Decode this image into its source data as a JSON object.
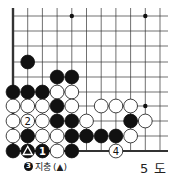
{
  "diagram": {
    "title": "5 도",
    "caption": {
      "move_number": "3",
      "text": "지충",
      "reference": "(▲)"
    },
    "board": {
      "columns": 11,
      "visible_rows": 10,
      "origin_x": 13,
      "spacing_x": 14.7,
      "row_y": [
        16,
        31,
        46,
        62,
        77,
        92,
        106,
        121,
        136,
        151
      ],
      "left_edge": true,
      "bottom_edge": true,
      "star_points": [
        [
          4,
          0
        ],
        [
          9,
          0
        ],
        [
          9,
          6
        ]
      ],
      "stones": [
        {
          "c": 1,
          "r": 3,
          "color": "black"
        },
        {
          "c": 3,
          "r": 4,
          "color": "black"
        },
        {
          "c": 4,
          "r": 4,
          "color": "black"
        },
        {
          "c": 0,
          "r": 5,
          "color": "black"
        },
        {
          "c": 1,
          "r": 5,
          "color": "black"
        },
        {
          "c": 2,
          "r": 5,
          "color": "black"
        },
        {
          "c": 3,
          "r": 5,
          "color": "white"
        },
        {
          "c": 4,
          "r": 5,
          "color": "white"
        },
        {
          "c": 0,
          "r": 6,
          "color": "white"
        },
        {
          "c": 1,
          "r": 6,
          "color": "white"
        },
        {
          "c": 2,
          "r": 6,
          "color": "white"
        },
        {
          "c": 3,
          "r": 6,
          "color": "black"
        },
        {
          "c": 4,
          "r": 6,
          "color": "white"
        },
        {
          "c": 6,
          "r": 6,
          "color": "white"
        },
        {
          "c": 7,
          "r": 6,
          "color": "white"
        },
        {
          "c": 8,
          "r": 6,
          "color": "white"
        },
        {
          "c": 0,
          "r": 7,
          "color": "white"
        },
        {
          "c": 1,
          "r": 7,
          "color": "white",
          "label": "2"
        },
        {
          "c": 2,
          "r": 7,
          "color": "white"
        },
        {
          "c": 3,
          "r": 7,
          "color": "black"
        },
        {
          "c": 4,
          "r": 7,
          "color": "black"
        },
        {
          "c": 5,
          "r": 7,
          "color": "white"
        },
        {
          "c": 8,
          "r": 7,
          "color": "black"
        },
        {
          "c": 9,
          "r": 7,
          "color": "white"
        },
        {
          "c": 0,
          "r": 8,
          "color": "white"
        },
        {
          "c": 1,
          "r": 8,
          "color": "black"
        },
        {
          "c": 2,
          "r": 8,
          "color": "white"
        },
        {
          "c": 3,
          "r": 8,
          "color": "white"
        },
        {
          "c": 4,
          "r": 8,
          "color": "black"
        },
        {
          "c": 5,
          "r": 8,
          "color": "black"
        },
        {
          "c": 6,
          "r": 8,
          "color": "black"
        },
        {
          "c": 7,
          "r": 8,
          "color": "black"
        },
        {
          "c": 8,
          "r": 8,
          "color": "white"
        },
        {
          "c": 0,
          "r": 9,
          "color": "black"
        },
        {
          "c": 1,
          "r": 9,
          "color": "black",
          "mark": "triangle"
        },
        {
          "c": 2,
          "r": 9,
          "color": "black",
          "label": "1"
        },
        {
          "c": 3,
          "r": 9,
          "color": "white"
        },
        {
          "c": 4,
          "r": 9,
          "color": "black"
        },
        {
          "c": 7,
          "r": 9,
          "color": "white",
          "label": "4"
        }
      ]
    }
  }
}
